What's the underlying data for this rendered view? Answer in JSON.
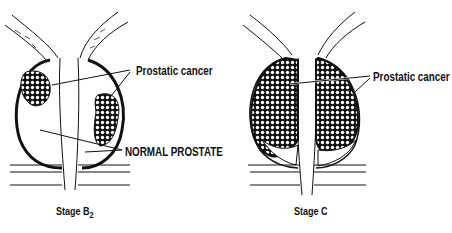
{
  "figure": {
    "panels": [
      {
        "id": "stage-b2",
        "caption": "Stage B",
        "caption_subscript": "2",
        "labels": {
          "cancer": "Prostatic cancer",
          "normal": "NORMAL PROSTATE"
        }
      },
      {
        "id": "stage-c",
        "caption": "Stage C",
        "labels": {
          "cancer": "Prostatic cancer"
        }
      }
    ],
    "colors": {
      "ink": "#111111",
      "background": "#ffffff"
    }
  }
}
